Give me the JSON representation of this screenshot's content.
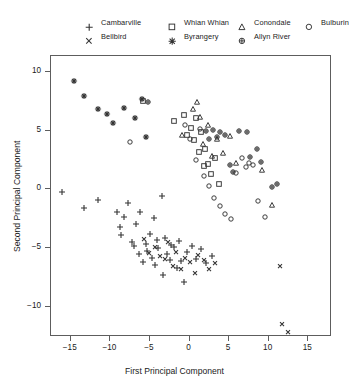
{
  "chart_data": {
    "type": "scatter",
    "title": "",
    "xlabel": "First Principal Component",
    "ylabel": "Second Principal Component",
    "xlim": [
      -17.5,
      18.0
    ],
    "ylim": [
      -12.6,
      11.4
    ],
    "xticks": [
      -15,
      -10,
      -5,
      0,
      5,
      10,
      15
    ],
    "yticks": [
      10,
      5,
      0,
      -5,
      -10
    ],
    "xticklabels": [
      "-15",
      "-10",
      "-5",
      "0",
      "5",
      "10",
      "15"
    ],
    "yticklabels": [
      "10",
      "5",
      "0",
      "-5",
      "-10"
    ],
    "grid": false,
    "legend_position": "top",
    "series": [
      {
        "name": "Cambarville",
        "marker": "plus",
        "points": [
          [
            -16.0,
            -0.3
          ],
          [
            -13.2,
            -1.7
          ],
          [
            -11.4,
            -1.0
          ],
          [
            -9.0,
            -2.0
          ],
          [
            -8.6,
            -3.3
          ],
          [
            -8.5,
            -4.0
          ],
          [
            -8.2,
            -2.4
          ],
          [
            -7.6,
            -1.2
          ],
          [
            -7.1,
            -4.6
          ],
          [
            -6.9,
            -4.9
          ],
          [
            -6.6,
            -3.0
          ],
          [
            -6.2,
            -5.6
          ],
          [
            -6.1,
            -2.0
          ],
          [
            -5.8,
            -6.3
          ],
          [
            -5.4,
            -4.7
          ],
          [
            -5.2,
            -5.3
          ],
          [
            -4.9,
            -3.9
          ],
          [
            -4.6,
            -5.9
          ],
          [
            -4.4,
            -2.5
          ],
          [
            -4.2,
            -6.5
          ],
          [
            -4.0,
            -4.4
          ],
          [
            -3.8,
            -5.1
          ],
          [
            -3.4,
            -0.6
          ],
          [
            -3.2,
            -7.4
          ],
          [
            -3.0,
            -4.2
          ],
          [
            -2.7,
            -5.6
          ],
          [
            -2.4,
            -6.1
          ],
          [
            -2.2,
            -4.8
          ],
          [
            -1.8,
            -5.0
          ],
          [
            -1.5,
            -6.8
          ],
          [
            -1.2,
            -4.5
          ],
          [
            -0.9,
            -6.2
          ],
          [
            -0.6,
            -8.0
          ],
          [
            -0.2,
            -5.4
          ],
          [
            0.4,
            -4.9
          ],
          [
            0.9,
            -6.0
          ],
          [
            1.6,
            -5.2
          ],
          [
            2.2,
            -6.4
          ],
          [
            3.0,
            -5.8
          ]
        ]
      },
      {
        "name": "Bellbird",
        "marker": "cross",
        "points": [
          [
            -5.6,
            -4.3
          ],
          [
            -5.0,
            -5.5
          ],
          [
            -4.2,
            -5.0
          ],
          [
            -3.6,
            -5.8
          ],
          [
            -3.0,
            -6.0
          ],
          [
            -2.6,
            -4.6
          ],
          [
            -2.0,
            -6.6
          ],
          [
            -1.6,
            -5.4
          ],
          [
            -1.0,
            -6.9
          ],
          [
            -0.4,
            -5.9
          ],
          [
            0.2,
            -6.3
          ],
          [
            0.8,
            -7.2
          ],
          [
            1.2,
            -5.7
          ],
          [
            1.9,
            -6.1
          ],
          [
            2.6,
            -6.9
          ],
          [
            3.4,
            -6.4
          ],
          [
            11.5,
            -6.6
          ],
          [
            11.8,
            -11.6
          ],
          [
            12.6,
            -12.3
          ]
        ]
      },
      {
        "name": "Whian Whian",
        "marker": "square",
        "points": [
          [
            -5.8,
            7.5
          ],
          [
            -1.8,
            5.8
          ],
          [
            -0.6,
            6.3
          ],
          [
            -0.2,
            4.6
          ],
          [
            0.3,
            5.2
          ],
          [
            0.7,
            4.1
          ],
          [
            1.0,
            6.0
          ],
          [
            1.3,
            3.1
          ],
          [
            1.6,
            4.8
          ],
          [
            1.9,
            1.9
          ],
          [
            2.1,
            3.4
          ],
          [
            2.5,
            2.1
          ],
          [
            2.8,
            1.2
          ],
          [
            3.3,
            2.6
          ],
          [
            3.8,
            0.4
          ]
        ]
      },
      {
        "name": "Byrangery",
        "marker": "asterisk",
        "points": [
          [
            -14.5,
            9.2
          ],
          [
            -13.2,
            7.9
          ],
          [
            -11.4,
            6.8
          ],
          [
            -10.3,
            6.4
          ],
          [
            -9.6,
            5.6
          ],
          [
            -8.2,
            6.9
          ],
          [
            -6.8,
            6.0
          ],
          [
            -5.9,
            7.6
          ],
          [
            -5.4,
            4.4
          ]
        ]
      },
      {
        "name": "Conondale",
        "marker": "triangle",
        "points": [
          [
            -0.8,
            4.6
          ],
          [
            0.6,
            6.8
          ],
          [
            1.1,
            7.4
          ],
          [
            1.4,
            6.1
          ],
          [
            1.8,
            3.8
          ],
          [
            2.4,
            5.4
          ],
          [
            3.0,
            2.8
          ],
          [
            3.6,
            4.2
          ],
          [
            4.4,
            3.0
          ],
          [
            5.2,
            4.5
          ],
          [
            6.0,
            2.2
          ],
          [
            9.3,
            1.6
          ],
          [
            10.6,
            -1.4
          ]
        ]
      },
      {
        "name": "Allyn River",
        "marker": "circleplus",
        "points": [
          [
            -5.1,
            7.4
          ],
          [
            2.2,
            4.9
          ],
          [
            2.6,
            4.2
          ],
          [
            3.1,
            5.0
          ],
          [
            3.6,
            4.4
          ],
          [
            4.0,
            4.8
          ],
          [
            4.6,
            4.6
          ],
          [
            5.2,
            2.0
          ],
          [
            5.6,
            1.4
          ],
          [
            6.4,
            4.9
          ],
          [
            7.4,
            4.8
          ],
          [
            7.8,
            2.7
          ],
          [
            8.6,
            3.4
          ],
          [
            9.2,
            2.3
          ],
          [
            10.5,
            0.1
          ],
          [
            11.2,
            0.4
          ]
        ]
      },
      {
        "name": "Bulburin",
        "marker": "circle",
        "points": [
          [
            -7.4,
            4.0
          ],
          [
            -0.4,
            5.4
          ],
          [
            0.2,
            4.2
          ],
          [
            0.9,
            2.4
          ],
          [
            1.4,
            5.1
          ],
          [
            2.0,
            1.1
          ],
          [
            2.6,
            0.2
          ],
          [
            3.2,
            -0.8
          ],
          [
            4.0,
            -1.5
          ],
          [
            4.6,
            -2.2
          ],
          [
            5.4,
            -2.6
          ],
          [
            6.0,
            1.3
          ],
          [
            6.8,
            2.6
          ],
          [
            7.2,
            1.8
          ],
          [
            7.6,
            2.2
          ],
          [
            8.2,
            2.0
          ],
          [
            8.8,
            -1.1
          ],
          [
            9.6,
            -2.4
          ]
        ]
      }
    ]
  },
  "legend": {
    "items": [
      {
        "label": "Cambarville",
        "marker": "plus"
      },
      {
        "label": "Bellbird",
        "marker": "cross"
      },
      {
        "label": "Whian Whian",
        "marker": "square"
      },
      {
        "label": "Byrangery",
        "marker": "asterisk"
      },
      {
        "label": "Conondale",
        "marker": "triangle"
      },
      {
        "label": "Allyn River",
        "marker": "circleplus"
      },
      {
        "label": "Bulburin",
        "marker": "circle"
      }
    ],
    "columns": [
      {
        "x": 85,
        "rows": [
          0,
          1
        ]
      },
      {
        "x": 168,
        "rows": [
          2,
          3
        ]
      },
      {
        "x": 238,
        "rows": [
          4,
          5
        ]
      },
      {
        "x": 305,
        "rows": [
          6
        ]
      }
    ],
    "row_y": [
      16,
      30
    ]
  },
  "style": {
    "marker_color": "#333333",
    "axis_color": "#5d5d5d",
    "background": "#ffffff"
  }
}
